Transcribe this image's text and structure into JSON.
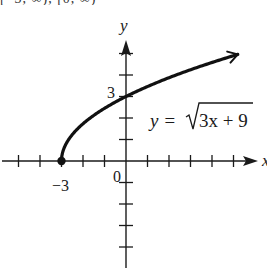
{
  "chart_data": {
    "type": "line",
    "title": "",
    "equation_label": {
      "lhs": "y =",
      "radicand": "3x + 9"
    },
    "xlabel": "x",
    "ylabel": "y",
    "function": "y = sqrt(3x + 9)",
    "series": [
      {
        "name": "y = √(3x + 9)",
        "x": [
          -3,
          -2.75,
          -2.5,
          -2,
          -1.5,
          -1,
          0,
          1,
          2,
          3,
          4,
          5,
          5.2
        ],
        "values": [
          0,
          0.87,
          1.22,
          1.73,
          2.12,
          2.45,
          3,
          3.46,
          3.87,
          4.24,
          4.58,
          4.9,
          4.96
        ],
        "start_point": {
          "x": -3,
          "y": 0,
          "marker": "filled-dot"
        },
        "end": "arrow"
      }
    ],
    "tick_labels": {
      "x": [
        "-3",
        "0"
      ],
      "y": [
        "3"
      ]
    },
    "x_ticks": [
      -5,
      -4,
      -3,
      -2,
      -1,
      1,
      2,
      3,
      4,
      5
    ],
    "y_ticks": [
      -4,
      -3,
      -2,
      -1,
      1,
      2,
      3,
      4,
      5
    ],
    "xlim": [
      -5.8,
      6.2
    ],
    "ylim": [
      -5,
      5.5
    ],
    "grid": false,
    "legend": "none"
  },
  "labels": {
    "x_axis": "x",
    "y_axis": "y",
    "origin": "0",
    "x_tick_minus3": "−3",
    "y_tick_3": "3",
    "eq_lhs": "y =",
    "eq_radicand": "3x + 9",
    "cutoff_text": "[−3, ∞), [0, ∞)"
  }
}
